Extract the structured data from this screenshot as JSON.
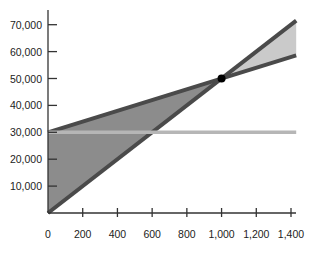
{
  "chart_data": {
    "type": "line",
    "title": "",
    "xlabel": "",
    "ylabel": "",
    "xlim": [
      0,
      1430
    ],
    "ylim": [
      0,
      75000
    ],
    "grid": false,
    "x_ticks": [
      0,
      200,
      400,
      600,
      800,
      1000,
      1200,
      1400
    ],
    "x_tick_labels": [
      "0",
      "200",
      "400",
      "600",
      "800",
      "1,000",
      "1,200",
      "1,400"
    ],
    "y_ticks": [
      10000,
      20000,
      30000,
      40000,
      50000,
      60000,
      70000
    ],
    "y_tick_labels": [
      "10,000",
      "20,000",
      "30,000",
      "40,000",
      "50,000",
      "60,000",
      "70,000"
    ],
    "series": [
      {
        "name": "Total Revenue",
        "x": [
          0,
          1430
        ],
        "y": [
          0,
          71500
        ]
      },
      {
        "name": "Total Cost",
        "x": [
          0,
          1430
        ],
        "y": [
          30000,
          58600
        ]
      },
      {
        "name": "Fixed Cost",
        "x": [
          0,
          1430
        ],
        "y": [
          30000,
          30000
        ]
      }
    ],
    "regions": [
      {
        "name": "Loss area",
        "between": [
          "Total Cost",
          "Total Revenue"
        ],
        "x_range": [
          0,
          1000
        ]
      },
      {
        "name": "Profit area",
        "between": [
          "Total Revenue",
          "Total Cost"
        ],
        "x_range": [
          1000,
          1430
        ]
      }
    ],
    "annotations": [
      {
        "type": "point",
        "label": "Break-even point",
        "x": 1000,
        "y": 50000
      }
    ]
  },
  "colors": {
    "loss_fill": "#8c8c8c",
    "profit_fill": "#cacaca",
    "line_dark": "#4a4a4a",
    "fixed_line": "#b6b6b6",
    "axis": "#333333",
    "point": "#000000"
  }
}
